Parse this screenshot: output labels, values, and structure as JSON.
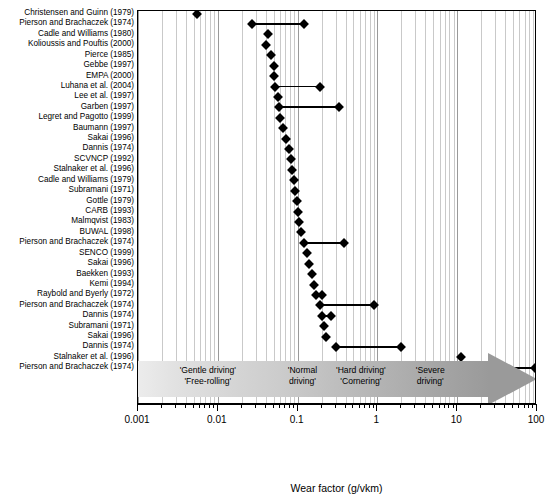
{
  "chart_data": {
    "type": "bar",
    "orientation": "horizontal",
    "title": "",
    "xlabel": "Wear factor (g/vkm)",
    "ylabel": "",
    "xscale": "log",
    "xlim": [
      0.001,
      100
    ],
    "xticks": [
      0.001,
      0.01,
      0.1,
      1,
      10,
      100
    ],
    "xticklabels": [
      "0.001",
      "0.01",
      "0.1",
      "1",
      "10",
      "100"
    ],
    "grid": true,
    "legend": "none",
    "categories": [
      "Christensen and Guinn (1979)",
      "Pierson and Brachaczek (1974)",
      "Cadle and Williams (1980)",
      "Kolioussis and Pouftis (2000)",
      "Pierce (1985)",
      "Gebbe (1997)",
      "EMPA (2000)",
      "Luhana et al. (2004)",
      "Lee et al. (1997)",
      "Garben (1997)",
      "Legret and Pagotto (1999)",
      "Baumann (1997)",
      "Sakai (1996)",
      "Dannis (1974)",
      "SCVNCP (1992)",
      "Stalnaker et al. (1996)",
      "Cadle and Williams (1979)",
      "Subramani (1971)",
      "Gottle (1979)",
      "CARB (1993)",
      "Malmqvist (1983)",
      "BUWAL (1998)",
      "Pierson and Brachaczek (1974)",
      "SENCO (1999)",
      "Sakai (1996)",
      "Baekken (1993)",
      "Kemi (1994)",
      "Raybold and Byerly (1972)",
      "Pierson and Brachaczek (1974)",
      "Dannis (1974)",
      "Subramani (1971)",
      "Sakai (1996)",
      "Dannis (1974)",
      "Stalnaker et al. (1996)",
      "Pierson and Brachaczek (1974)"
    ],
    "values_low": [
      0.0055,
      0.027,
      0.043,
      0.04,
      0.046,
      0.05,
      0.051,
      0.052,
      0.057,
      0.058,
      0.06,
      0.065,
      0.072,
      0.077,
      0.082,
      0.086,
      0.09,
      0.093,
      0.097,
      0.1,
      0.104,
      0.11,
      0.12,
      0.13,
      0.14,
      0.15,
      0.16,
      0.17,
      0.19,
      0.205,
      0.215,
      0.23,
      0.3,
      11.0,
      13.0
    ],
    "values_high": [
      0.0055,
      0.12,
      0.043,
      0.04,
      0.046,
      0.05,
      0.051,
      0.19,
      0.057,
      0.33,
      0.06,
      0.065,
      0.072,
      0.077,
      0.082,
      0.086,
      0.09,
      0.093,
      0.097,
      0.1,
      0.104,
      0.11,
      0.38,
      0.13,
      0.14,
      0.15,
      0.16,
      0.205,
      0.9,
      0.265,
      0.215,
      0.23,
      2.0,
      11.0,
      95.0
    ],
    "annotations": [
      {
        "name": "gentle",
        "lines": [
          "'Gentle driving'",
          "'Free-rolling'"
        ],
        "x_center": 0.0075
      },
      {
        "name": "normal",
        "lines": [
          "'Normal",
          "driving'"
        ],
        "x_center": 0.115
      },
      {
        "name": "hard",
        "lines": [
          "'Hard driving'",
          "'Cornering'"
        ],
        "x_center": 0.62
      },
      {
        "name": "severe",
        "lines": [
          "'Severe",
          "driving'"
        ],
        "x_center": 4.6
      }
    ],
    "arrow": {
      "label": "driving-severity-arrow",
      "from": 0.001,
      "to": 100,
      "gradient_from": "#ececec",
      "gradient_to": "#9a9a9a"
    }
  },
  "colors": {
    "marker": "#000000",
    "grid_minor": "#c9c9c9",
    "grid_major": "#9a9a9a",
    "axis": "#000000",
    "background": "#ffffff"
  }
}
